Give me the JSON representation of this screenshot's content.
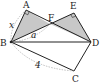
{
  "figure": {
    "type": "geometry-diagram",
    "points": {
      "A": {
        "label": "A",
        "x": 26,
        "y": 10
      },
      "B": {
        "label": "B",
        "x": 11,
        "y": 42
      },
      "C": {
        "label": "C",
        "x": 74,
        "y": 71
      },
      "D": {
        "label": "D",
        "x": 91,
        "y": 42
      },
      "E": {
        "label": "E",
        "x": 74,
        "y": 13
      },
      "F": {
        "label": "F",
        "x": 50,
        "y": 24
      }
    },
    "segment_labels": {
      "AB": "x",
      "BF": "a",
      "BC": "4"
    },
    "colors": {
      "line": "#222222",
      "shade": "#c8c8c8",
      "dashed": "#999999"
    }
  }
}
